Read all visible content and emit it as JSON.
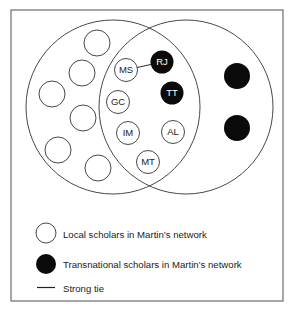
{
  "diagram": {
    "type": "venn-network",
    "frame": {
      "x": 11,
      "y": 10,
      "width": 272,
      "height": 291,
      "stroke": "#777777"
    },
    "sets": [
      {
        "id": "left-set",
        "cx": 113,
        "cy": 107,
        "r": 87
      },
      {
        "id": "right-set",
        "cx": 186,
        "cy": 107,
        "r": 87
      }
    ],
    "nodes": [
      {
        "id": "MS",
        "label": "MS",
        "type": "local",
        "cx": 126,
        "cy": 70,
        "r": 11.5
      },
      {
        "id": "RJ",
        "label": "RJ",
        "type": "transnational",
        "cx": 162,
        "cy": 62,
        "r": 11.5
      },
      {
        "id": "TT",
        "label": "TT",
        "type": "transnational",
        "cx": 172,
        "cy": 93,
        "r": 11.5
      },
      {
        "id": "GC",
        "label": "GC",
        "type": "local",
        "cx": 118,
        "cy": 102,
        "r": 11.5
      },
      {
        "id": "IM",
        "label": "IM",
        "type": "local",
        "cx": 128,
        "cy": 133,
        "r": 11.5
      },
      {
        "id": "AL",
        "label": "AL",
        "type": "local",
        "cx": 173,
        "cy": 132,
        "r": 11.5
      },
      {
        "id": "MT",
        "label": "MT",
        "type": "local",
        "cx": 148,
        "cy": 162,
        "r": 11.5
      },
      {
        "id": "L1",
        "label": "",
        "type": "local",
        "cx": 97,
        "cy": 43,
        "r": 13
      },
      {
        "id": "L2",
        "label": "",
        "type": "local",
        "cx": 82,
        "cy": 73,
        "r": 13
      },
      {
        "id": "L3",
        "label": "",
        "type": "local",
        "cx": 52,
        "cy": 94,
        "r": 13
      },
      {
        "id": "L4",
        "label": "",
        "type": "local",
        "cx": 83,
        "cy": 118,
        "r": 13
      },
      {
        "id": "L5",
        "label": "",
        "type": "local",
        "cx": 58,
        "cy": 150,
        "r": 13
      },
      {
        "id": "L6",
        "label": "",
        "type": "local",
        "cx": 98,
        "cy": 168,
        "r": 13
      },
      {
        "id": "T1",
        "label": "",
        "type": "transnational",
        "cx": 237,
        "cy": 76,
        "r": 13
      },
      {
        "id": "T2",
        "label": "",
        "type": "transnational",
        "cx": 237,
        "cy": 128,
        "r": 13
      }
    ],
    "edges": [
      {
        "from": "MS",
        "to": "RJ",
        "type": "strong-tie"
      }
    ],
    "colors": {
      "local_fill": "#ffffff",
      "transnational_fill": "#0a0a0a",
      "stroke": "#333333",
      "text_dark": "#222222",
      "text_light": "#ffffff"
    }
  },
  "legend": {
    "items": [
      {
        "symbol": "open-circle",
        "label": "Local scholars in Martin’s network"
      },
      {
        "symbol": "filled-circle",
        "label": "Transnational scholars in Martin’s network"
      },
      {
        "symbol": "line",
        "label": "Strong tie"
      }
    ]
  }
}
